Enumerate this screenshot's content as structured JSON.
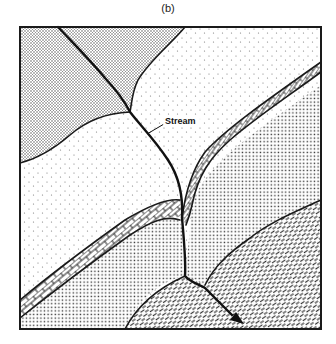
{
  "figure": {
    "caption": "(b)",
    "type": "geologic map diagram",
    "labels": {
      "stream": "Stream"
    },
    "units": [
      {
        "id": "unit-dense-stipple",
        "pattern": "fine dense dots"
      },
      {
        "id": "unit-sparse-stipple",
        "pattern": "sparse dots"
      },
      {
        "id": "unit-medium-dots",
        "pattern": "medium regular dots"
      },
      {
        "id": "unit-brick",
        "pattern": "brick (limestone)"
      },
      {
        "id": "unit-dashes",
        "pattern": "oblique dashes"
      }
    ],
    "colors": {
      "ink": "#1a1a1a",
      "paper": "#ffffff"
    }
  }
}
